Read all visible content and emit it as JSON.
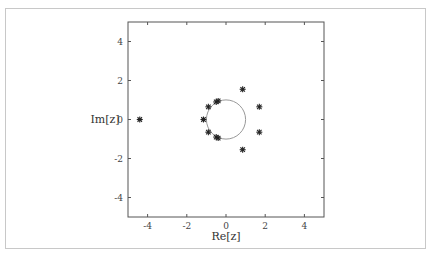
{
  "chart_data": {
    "type": "scatter",
    "title": "",
    "xlabel": "Re[z]",
    "ylabel": "Im[z]",
    "xlim": [
      -5,
      5
    ],
    "ylim": [
      -5,
      5
    ],
    "xticks": [
      -4,
      -2,
      0,
      2,
      4
    ],
    "yticks": [
      4,
      2,
      0,
      -2,
      -4
    ],
    "xtick_labels": [
      "-4",
      "-2",
      "0",
      "2",
      "4"
    ],
    "ytick_labels": [
      "4",
      "2",
      "0",
      "-2",
      "-4"
    ],
    "grid": false,
    "legend": null,
    "marker": "asterisk",
    "series": [
      {
        "name": "roots",
        "points": [
          {
            "x": -4.4,
            "y": 0.0
          },
          {
            "x": -1.15,
            "y": 0.0
          },
          {
            "x": -0.9,
            "y": 0.65
          },
          {
            "x": -0.9,
            "y": -0.65
          },
          {
            "x": -0.5,
            "y": 0.9
          },
          {
            "x": -0.4,
            "y": 0.95
          },
          {
            "x": -0.5,
            "y": -0.9
          },
          {
            "x": -0.4,
            "y": -0.95
          },
          {
            "x": 0.85,
            "y": 1.55
          },
          {
            "x": 0.85,
            "y": -1.55
          },
          {
            "x": 1.7,
            "y": 0.65
          },
          {
            "x": 1.7,
            "y": -0.65
          }
        ]
      }
    ],
    "annotations": [
      {
        "type": "circle",
        "center": [
          0,
          0
        ],
        "radius": 1,
        "color": "#999999"
      }
    ]
  }
}
